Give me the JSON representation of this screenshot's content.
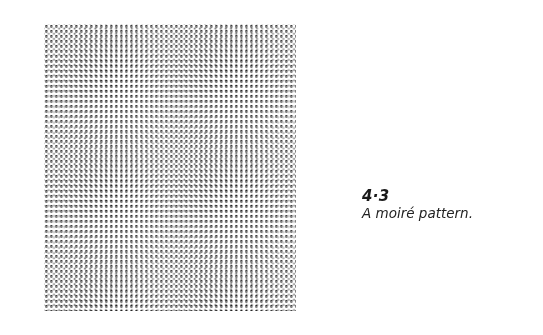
{
  "figure": {
    "type": "moire-pattern-image"
  },
  "caption": {
    "number": "4·3",
    "text": "A moiré pattern."
  }
}
